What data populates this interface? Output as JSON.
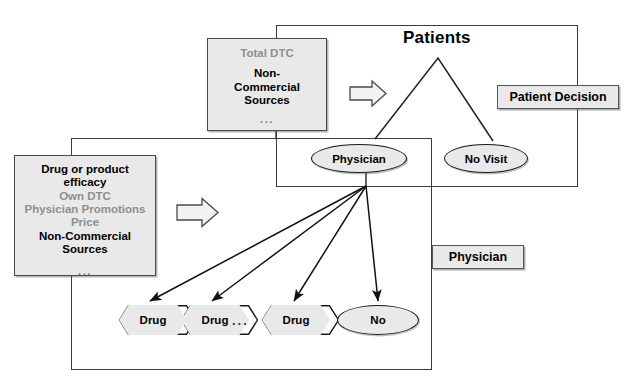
{
  "figure": {
    "title_patients": "Patients"
  },
  "boxes": {
    "total_dtc": {
      "name": "Total DTC",
      "lines": [
        {
          "text": "Total DTC",
          "style": "grey"
        },
        {
          "text": "Non-",
          "style": "black"
        },
        {
          "text": "Commercial",
          "style": "black"
        },
        {
          "text": "Sources",
          "style": "black"
        },
        {
          "text": "...",
          "style": "dots"
        }
      ]
    },
    "drug_attributes": {
      "name": "Drug or product efficacy",
      "lines": [
        {
          "text": "Drug or product",
          "style": "black"
        },
        {
          "text": "efficacy",
          "style": "black"
        },
        {
          "text": "Own DTC",
          "style": "grey"
        },
        {
          "text": "Physician Promotions",
          "style": "grey"
        },
        {
          "text": "Price",
          "style": "grey"
        },
        {
          "text": "Non-Commercial",
          "style": "black"
        },
        {
          "text": "Sources",
          "style": "black"
        },
        {
          "text": "...",
          "style": "dots"
        }
      ]
    }
  },
  "plates": {
    "patient_decision": "Patient Decision",
    "physician": "Physician"
  },
  "nodes": {
    "physician": "Physician",
    "no_visit": "No Visit",
    "no": "No",
    "drug_1": "Drug",
    "drug_2": "Drug",
    "drug_3": "Drug",
    "drug_ellipsis": "..."
  },
  "colors": {
    "box_fill": "#e9e9e9",
    "box_border": "#4a4a4a",
    "frame_border": "#3a3a3a",
    "text_black": "#000000",
    "text_grey": "#8e8e8e",
    "line": "#1a1a1a"
  },
  "icons": {
    "block_arrow_top": "block-arrow-right-icon",
    "block_arrow_left": "block-arrow-right-icon"
  }
}
